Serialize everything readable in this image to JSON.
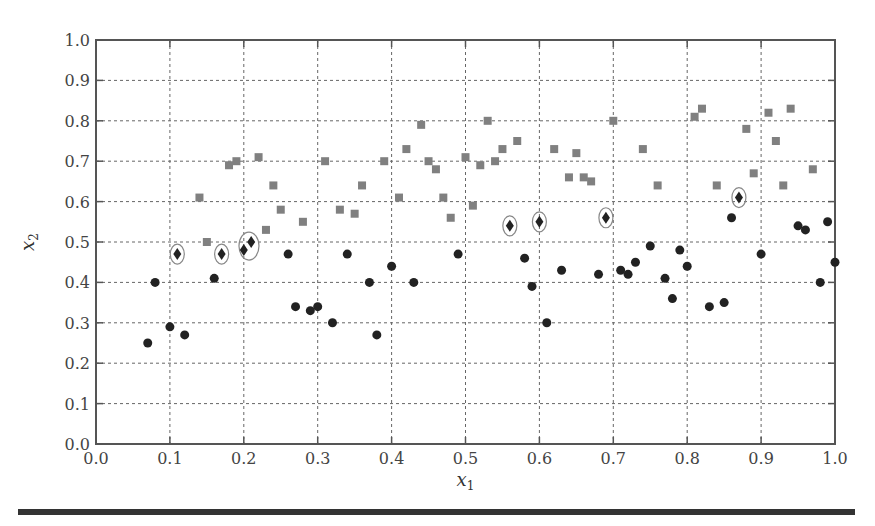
{
  "chart_data": {
    "type": "scatter",
    "title": "",
    "xlabel": "x",
    "xlabel_sub": "1",
    "ylabel": "x",
    "ylabel_sub": "2",
    "xlim": [
      0.0,
      1.0
    ],
    "ylim": [
      0.0,
      1.0
    ],
    "xticks": [
      "0.0",
      "0.1",
      "0.2",
      "0.3",
      "0.4",
      "0.5",
      "0.6",
      "0.7",
      "0.8",
      "0.9",
      "1.0"
    ],
    "yticks": [
      "0.0",
      "0.1",
      "0.2",
      "0.3",
      "0.4",
      "0.5",
      "0.6",
      "0.7",
      "0.8",
      "0.9",
      "1.0"
    ],
    "grid": true,
    "legend": null,
    "series": [
      {
        "name": "class-1",
        "marker": "circle",
        "color": "#222222",
        "points": [
          [
            0.07,
            0.25
          ],
          [
            0.08,
            0.4
          ],
          [
            0.1,
            0.29
          ],
          [
            0.12,
            0.27
          ],
          [
            0.16,
            0.41
          ],
          [
            0.26,
            0.47
          ],
          [
            0.27,
            0.34
          ],
          [
            0.29,
            0.33
          ],
          [
            0.3,
            0.34
          ],
          [
            0.32,
            0.3
          ],
          [
            0.34,
            0.47
          ],
          [
            0.37,
            0.4
          ],
          [
            0.38,
            0.27
          ],
          [
            0.4,
            0.44
          ],
          [
            0.43,
            0.4
          ],
          [
            0.49,
            0.47
          ],
          [
            0.58,
            0.46
          ],
          [
            0.59,
            0.39
          ],
          [
            0.61,
            0.3
          ],
          [
            0.63,
            0.43
          ],
          [
            0.68,
            0.42
          ],
          [
            0.71,
            0.43
          ],
          [
            0.72,
            0.42
          ],
          [
            0.73,
            0.45
          ],
          [
            0.75,
            0.49
          ],
          [
            0.77,
            0.41
          ],
          [
            0.78,
            0.36
          ],
          [
            0.79,
            0.48
          ],
          [
            0.8,
            0.44
          ],
          [
            0.83,
            0.34
          ],
          [
            0.85,
            0.35
          ],
          [
            0.86,
            0.56
          ],
          [
            0.9,
            0.47
          ],
          [
            0.95,
            0.54
          ],
          [
            0.96,
            0.53
          ],
          [
            0.98,
            0.4
          ],
          [
            0.99,
            0.55
          ],
          [
            1.0,
            0.45
          ]
        ]
      },
      {
        "name": "class-2",
        "marker": "square",
        "color": "#808080",
        "points": [
          [
            0.14,
            0.61
          ],
          [
            0.15,
            0.5
          ],
          [
            0.18,
            0.69
          ],
          [
            0.19,
            0.7
          ],
          [
            0.22,
            0.71
          ],
          [
            0.23,
            0.53
          ],
          [
            0.24,
            0.64
          ],
          [
            0.25,
            0.58
          ],
          [
            0.28,
            0.55
          ],
          [
            0.31,
            0.7
          ],
          [
            0.33,
            0.58
          ],
          [
            0.35,
            0.57
          ],
          [
            0.36,
            0.64
          ],
          [
            0.39,
            0.7
          ],
          [
            0.41,
            0.61
          ],
          [
            0.42,
            0.73
          ],
          [
            0.44,
            0.79
          ],
          [
            0.45,
            0.7
          ],
          [
            0.46,
            0.68
          ],
          [
            0.47,
            0.61
          ],
          [
            0.48,
            0.56
          ],
          [
            0.5,
            0.71
          ],
          [
            0.51,
            0.59
          ],
          [
            0.52,
            0.69
          ],
          [
            0.53,
            0.8
          ],
          [
            0.54,
            0.7
          ],
          [
            0.55,
            0.73
          ],
          [
            0.57,
            0.75
          ],
          [
            0.62,
            0.73
          ],
          [
            0.64,
            0.66
          ],
          [
            0.65,
            0.72
          ],
          [
            0.66,
            0.66
          ],
          [
            0.67,
            0.65
          ],
          [
            0.7,
            0.8
          ],
          [
            0.74,
            0.73
          ],
          [
            0.76,
            0.64
          ],
          [
            0.81,
            0.81
          ],
          [
            0.82,
            0.83
          ],
          [
            0.84,
            0.64
          ],
          [
            0.88,
            0.78
          ],
          [
            0.89,
            0.67
          ],
          [
            0.91,
            0.82
          ],
          [
            0.92,
            0.75
          ],
          [
            0.93,
            0.64
          ],
          [
            0.94,
            0.83
          ],
          [
            0.97,
            0.68
          ]
        ]
      },
      {
        "name": "circled-diamonds",
        "marker": "diamond",
        "color": "#222222",
        "circled": true,
        "points": [
          [
            0.11,
            0.47
          ],
          [
            0.17,
            0.47
          ],
          [
            0.2,
            0.48
          ],
          [
            0.21,
            0.5
          ],
          [
            0.56,
            0.54
          ],
          [
            0.6,
            0.55
          ],
          [
            0.69,
            0.56
          ],
          [
            0.87,
            0.61
          ]
        ],
        "rings": [
          [
            0.11,
            0.47,
            7,
            10
          ],
          [
            0.17,
            0.47,
            7,
            10
          ],
          [
            0.207,
            0.49,
            10,
            14
          ],
          [
            0.56,
            0.54,
            7,
            10
          ],
          [
            0.6,
            0.55,
            7,
            10
          ],
          [
            0.69,
            0.56,
            7,
            10
          ],
          [
            0.87,
            0.61,
            7,
            10
          ]
        ]
      }
    ]
  },
  "layout": {
    "plot": {
      "left": 96,
      "top": 40,
      "right": 835,
      "bottom": 444
    },
    "colors": {
      "axis": "#555555",
      "grid": "#666666",
      "ring": "#888888"
    }
  }
}
